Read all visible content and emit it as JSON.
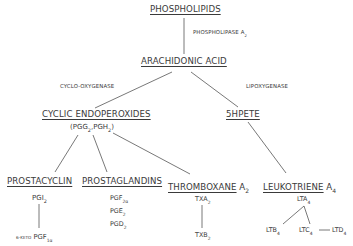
{
  "diagram": {
    "nodes": {
      "phospholipids": "PHOSPHOLIPIDS",
      "arachidonic_acid": "ARACHIDONIC ACID",
      "cyclic_endoperoxides": "CYCLIC ENDOPEROXIDES",
      "endoperoxides_detail": {
        "open": "(PGG",
        "sub1": "2",
        "mid": ",PGH",
        "sub2": "2",
        "close": ")"
      },
      "hpete": "5HPETE",
      "prostacyclin": "PROSTACYCLIN",
      "prostaglandins": "PROSTAGLANDINS",
      "thromboxane": {
        "label": "THROMBOXANE",
        "suffix": "A",
        "sub": "2"
      },
      "leukotriene": {
        "label": "LEUKOTRIENE",
        "suffix": "A",
        "sub": "4"
      },
      "pgi2": {
        "base": "PGI",
        "sub": "2"
      },
      "keto_pgf": {
        "prefix": "6-KETO",
        "base": "PGF",
        "sub": "1α"
      },
      "pgf2a": {
        "base": "PGF",
        "sub": "2α"
      },
      "pge2": {
        "base": "PGE",
        "sub": "2"
      },
      "pgd2": {
        "base": "PGD",
        "sub": "2"
      },
      "txa2": {
        "base": "TXA",
        "sub": "2"
      },
      "txb2": {
        "base": "TXB",
        "sub": "2"
      },
      "lta4": {
        "base": "LTA",
        "sub": "4"
      },
      "ltb4": {
        "base": "LTB",
        "sub": "4"
      },
      "ltc4": {
        "base": "LTC",
        "sub": "4"
      },
      "ltd4": {
        "base": "LTD",
        "sub": "4"
      }
    },
    "enzymes": {
      "phospholipase": {
        "base": "PHOSPHOLIPASE  A",
        "sub": "2"
      },
      "cyclooxygenase": "CYCLO-OXYGENASE",
      "lipoxygenase": "LIPOXYGENASE"
    }
  }
}
